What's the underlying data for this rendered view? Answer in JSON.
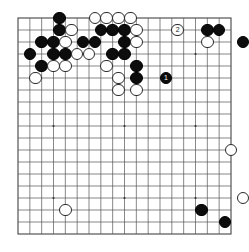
{
  "app": {
    "title": "Go Board Diagram",
    "board_type": "go-board"
  },
  "board": {
    "size": 19,
    "columns": 19,
    "rows": 19,
    "grid_color": "#555555",
    "border_color": "#444444",
    "background_color": "#ffffff",
    "black_stone_color": "#0d0d0d",
    "white_stone_color": "#ffffff",
    "star_points": [
      [
        3,
        3
      ],
      [
        9,
        3
      ],
      [
        15,
        3
      ],
      [
        3,
        9
      ],
      [
        9,
        9
      ],
      [
        15,
        9
      ],
      [
        3,
        15
      ],
      [
        9,
        15
      ],
      [
        15,
        15
      ]
    ]
  },
  "chart_data": {
    "type": "scatter",
    "xlabel": "",
    "ylabel": "",
    "grid": true,
    "xlim": [
      0,
      18
    ],
    "ylim": [
      0,
      18
    ],
    "legend": "",
    "stones": [
      {
        "color": "black",
        "col": 7,
        "row": 0,
        "label": ""
      },
      {
        "color": "white",
        "col": 13,
        "row": 0,
        "label": ""
      },
      {
        "color": "white",
        "col": 15,
        "row": 0,
        "label": ""
      },
      {
        "color": "white",
        "col": 17,
        "row": 0,
        "label": ""
      },
      {
        "color": "white",
        "col": 19,
        "row": 0,
        "label": ""
      },
      {
        "color": "black",
        "col": 7,
        "row": 2,
        "label": ""
      },
      {
        "color": "white",
        "col": 9,
        "row": 2,
        "label": ""
      },
      {
        "color": "black",
        "col": 14,
        "row": 2,
        "label": ""
      },
      {
        "color": "black",
        "col": 16,
        "row": 2,
        "label": ""
      },
      {
        "color": "black",
        "col": 18,
        "row": 2,
        "label": ""
      },
      {
        "color": "white",
        "col": 20,
        "row": 2,
        "label": ""
      },
      {
        "color": "white",
        "col": 27,
        "row": 2,
        "label": "2"
      },
      {
        "color": "black",
        "col": 32,
        "row": 2,
        "label": ""
      },
      {
        "color": "black",
        "col": 34,
        "row": 2,
        "label": ""
      },
      {
        "color": "black",
        "col": 4,
        "row": 4,
        "label": ""
      },
      {
        "color": "black",
        "col": 6,
        "row": 4,
        "label": ""
      },
      {
        "color": "white",
        "col": 8,
        "row": 4,
        "label": ""
      },
      {
        "color": "black",
        "col": 11,
        "row": 4,
        "label": ""
      },
      {
        "color": "black",
        "col": 13,
        "row": 4,
        "label": ""
      },
      {
        "color": "black",
        "col": 18,
        "row": 4,
        "label": ""
      },
      {
        "color": "white",
        "col": 20,
        "row": 4,
        "label": ""
      },
      {
        "color": "white",
        "col": 32,
        "row": 4,
        "label": ""
      },
      {
        "color": "black",
        "col": 38,
        "row": 4,
        "label": ""
      },
      {
        "color": "black",
        "col": 2,
        "row": 6,
        "label": ""
      },
      {
        "color": "black",
        "col": 6,
        "row": 6,
        "label": ""
      },
      {
        "color": "black",
        "col": 8,
        "row": 6,
        "label": ""
      },
      {
        "color": "white",
        "col": 10,
        "row": 6,
        "label": ""
      },
      {
        "color": "white",
        "col": 12,
        "row": 6,
        "label": ""
      },
      {
        "color": "black",
        "col": 16,
        "row": 6,
        "label": ""
      },
      {
        "color": "black",
        "col": 18,
        "row": 6,
        "label": ""
      },
      {
        "color": "black",
        "col": 4,
        "row": 8,
        "label": ""
      },
      {
        "color": "white",
        "col": 6,
        "row": 8,
        "label": ""
      },
      {
        "color": "white",
        "col": 8,
        "row": 8,
        "label": ""
      },
      {
        "color": "white",
        "col": 15,
        "row": 8,
        "label": ""
      },
      {
        "color": "black",
        "col": 20,
        "row": 8,
        "label": ""
      },
      {
        "color": "white",
        "col": 3,
        "row": 10,
        "label": ""
      },
      {
        "color": "white",
        "col": 17,
        "row": 10,
        "label": ""
      },
      {
        "color": "black",
        "col": 20,
        "row": 10,
        "label": ""
      },
      {
        "color": "black",
        "col": 25,
        "row": 10,
        "label": "1"
      },
      {
        "color": "white",
        "col": 17,
        "row": 12,
        "label": ""
      },
      {
        "color": "white",
        "col": 20,
        "row": 12,
        "label": ""
      },
      {
        "color": "white",
        "col": 36,
        "row": 22,
        "label": ""
      },
      {
        "color": "white",
        "col": 38,
        "row": 30,
        "label": ""
      },
      {
        "color": "white",
        "col": 8,
        "row": 32,
        "label": ""
      },
      {
        "color": "black",
        "col": 31,
        "row": 32,
        "label": ""
      },
      {
        "color": "black",
        "col": 35,
        "row": 34,
        "label": ""
      }
    ]
  }
}
